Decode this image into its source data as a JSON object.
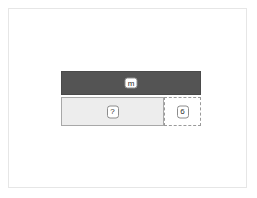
{
  "canvas": {
    "background_color": "#ffffff",
    "border_color": "#e6e6e6"
  },
  "diagram": {
    "rows": [
      {
        "name": "dark-bar",
        "fill_color": "#545454",
        "border_color": "#4a4a4a",
        "badge": {
          "label": "m",
          "background_color": "#ffffff",
          "text_color": "#2b2b2b",
          "border_color": "#8c8c8c"
        }
      },
      {
        "name": "light-row",
        "fill_color": "#ededed",
        "border_color": "#a8a8a8",
        "badge": {
          "label": "?",
          "background_color": "#ffffff",
          "text_color": "#2b2b2b",
          "border_color": "#8c8c8c"
        }
      }
    ],
    "dashed_region": {
      "name": "dashed-region",
      "fill_color": "#ffffff",
      "border_color": "#9a9a9a",
      "border_style": "dashed",
      "badge": {
        "label": "6",
        "background_color": "#ffffff",
        "text_color": "#2b2b2b",
        "border_color": "#8c8c8c"
      }
    }
  }
}
